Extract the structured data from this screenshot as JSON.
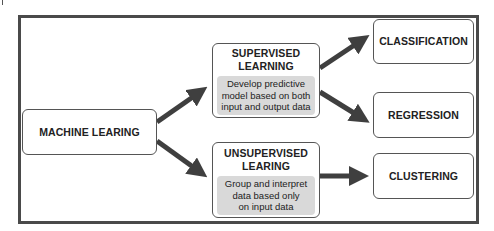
{
  "diagram": {
    "root": {
      "label": "MACHINE LEARING"
    },
    "branches": [
      {
        "label": "SUPERVISED LEARNING",
        "title_lines": [
          "SUPERVISED",
          "LEARNING"
        ],
        "description": "Develop predictive model based on both input and output data",
        "desc_lines": [
          "Develop predictive",
          "model based on both",
          "input and output data"
        ],
        "outcomes": [
          "CLASSIFICATION",
          "REGRESSION"
        ]
      },
      {
        "label": "UNSUPERVISED LEARING",
        "title_lines": [
          "UNSUPERVISED",
          "LEARING"
        ],
        "description": "Group and interpret data based only on input data",
        "desc_lines": [
          "Group and interpret",
          "data based only",
          "on input data"
        ],
        "outcomes": [
          "CLUSTERING"
        ]
      }
    ],
    "colors": {
      "frame": "#4a4a4a",
      "arrow": "#3f3f3f",
      "box_border": "#555555",
      "desc_fill": "#d9d9d9"
    }
  }
}
